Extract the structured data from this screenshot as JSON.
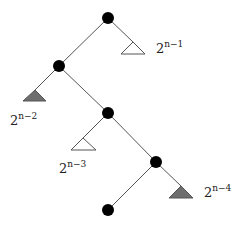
{
  "diagram": {
    "type": "binary-tree",
    "colors": {
      "node": "#000000",
      "edge": "#555555",
      "triangle_white_fill": "#ffffff",
      "triangle_gray_fill": "#6e6e6e",
      "triangle_stroke": "#555555"
    },
    "nodes": [
      {
        "id": "n1",
        "x": 108,
        "y": 18
      },
      {
        "id": "n2",
        "x": 59,
        "y": 66
      },
      {
        "id": "n3",
        "x": 108,
        "y": 113
      },
      {
        "id": "n4",
        "x": 156,
        "y": 162
      },
      {
        "id": "n5",
        "x": 108,
        "y": 210
      }
    ],
    "subtrees": [
      {
        "id": "t1",
        "parent": "n1",
        "side": "right",
        "fill": "white",
        "label_base": "2",
        "label_exp": "n−1"
      },
      {
        "id": "t2",
        "parent": "n2",
        "side": "left",
        "fill": "gray",
        "label_base": "2",
        "label_exp": "n−2"
      },
      {
        "id": "t3",
        "parent": "n3",
        "side": "left",
        "fill": "white",
        "label_base": "2",
        "label_exp": "n−3"
      },
      {
        "id": "t4",
        "parent": "n4",
        "side": "right",
        "fill": "gray",
        "label_base": "2",
        "label_exp": "n−4"
      }
    ]
  }
}
